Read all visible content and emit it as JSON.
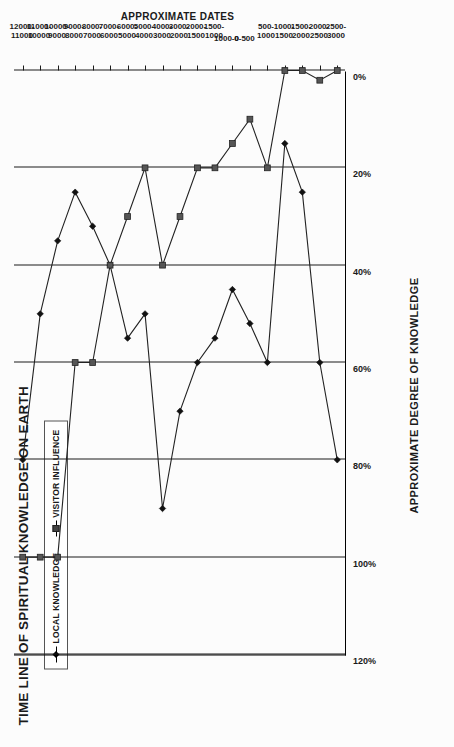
{
  "chart_data": {
    "type": "line",
    "title": "TIME LINE OF SPIRITUAL KNOWLEDGE ON EARTH",
    "xlabel": "APPROXIMATE DATES",
    "ylabel": "APPROXIMATE DEGREE OF KNOWLEDGE",
    "orientation": "rotated-90-ccw",
    "grid": true,
    "legend_position": "top-left",
    "ylim": [
      0,
      120
    ],
    "ytick_labels": [
      "120%",
      "100%",
      "80%",
      "60%",
      "40%",
      "20%",
      "0%"
    ],
    "ytick_values": [
      120,
      100,
      80,
      60,
      40,
      20,
      0
    ],
    "categories": [
      "12000-\n11000",
      "11000-\n10000",
      "10000-\n9000",
      "9000-\n8000",
      "8000-\n7000",
      "7000-\n6000",
      "6000-\n5000",
      "5000-\n4000",
      "4000-\n3000",
      "3000-\n2000",
      "2000-\n1500",
      "1500-\n1000",
      "1000-0",
      "0-500",
      "500-\n1000",
      "1000-\n1500",
      "1500-\n2000",
      "2000-\n2500",
      "2500-\n3000"
    ],
    "categories_line1": [
      "12000-",
      "11000-",
      "10000-",
      "9000-",
      "8000-",
      "7000-",
      "6000-",
      "5000-",
      "4000-",
      "3000-",
      "2000-",
      "1500-",
      "1000-0",
      "0-500",
      "500-",
      "1000-",
      "1500-",
      "2000-",
      "2500-"
    ],
    "categories_line2": [
      "11000",
      "10000",
      "9000",
      "8000",
      "7000",
      "6000",
      "5000",
      "4000",
      "3000",
      "2000",
      "1500",
      "1000",
      "",
      "",
      "1000",
      "1500",
      "2000",
      "2500",
      "3000"
    ],
    "series": [
      {
        "name": "LOCAL KNOWLEDGE",
        "marker": "diamond",
        "values": [
          80,
          50,
          35,
          25,
          32,
          40,
          55,
          50,
          90,
          70,
          60,
          55,
          45,
          52,
          60,
          15,
          25,
          60,
          80
        ]
      },
      {
        "name": "VISITOR INFLUENCE",
        "marker": "square",
        "values": [
          100,
          100,
          100,
          60,
          60,
          40,
          30,
          20,
          40,
          30,
          20,
          20,
          15,
          10,
          20,
          0,
          0,
          2,
          0
        ]
      }
    ]
  },
  "legend": {
    "items": [
      {
        "label": "LOCAL KNOWLEDGE",
        "marker": "diamond"
      },
      {
        "label": "VISITOR INFLUENCE",
        "marker": "square"
      }
    ]
  }
}
